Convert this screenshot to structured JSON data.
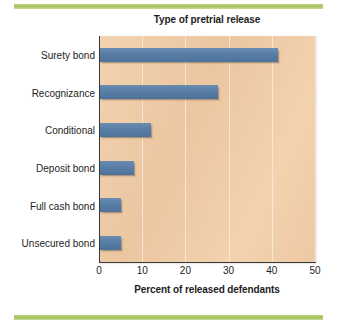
{
  "decorations": {
    "top_rule_color": "#a8c566",
    "bottom_rule_color": "#a8c566"
  },
  "colors": {
    "plot_background": "#f2cda6",
    "bar_fill": "#5b7fa6",
    "gridline": "#f7eadb",
    "axis": "#3b3b3b",
    "text": "#1d1d1d"
  },
  "chart_data": {
    "type": "bar",
    "orientation": "horizontal",
    "title": "Type of pretrial release",
    "xlabel": "Percent of released defendants",
    "ylabel": "",
    "categories": [
      "Surety bond",
      "Recognizance",
      "Conditional",
      "Deposit bond",
      "Full cash bond",
      "Unsecured bond"
    ],
    "values": [
      41.5,
      27.5,
      12,
      8,
      5,
      5
    ],
    "xlim": [
      0,
      50
    ],
    "xticks": [
      0,
      10,
      20,
      30,
      40,
      50
    ],
    "xtick_labels": [
      "0",
      "10",
      "20",
      "30",
      "40",
      "50"
    ],
    "grid": true,
    "grid_axis": "x",
    "legend": false,
    "series": [
      {
        "name": "Percent of released defendants",
        "values": [
          41.5,
          27.5,
          12,
          8,
          5,
          5
        ]
      }
    ]
  }
}
